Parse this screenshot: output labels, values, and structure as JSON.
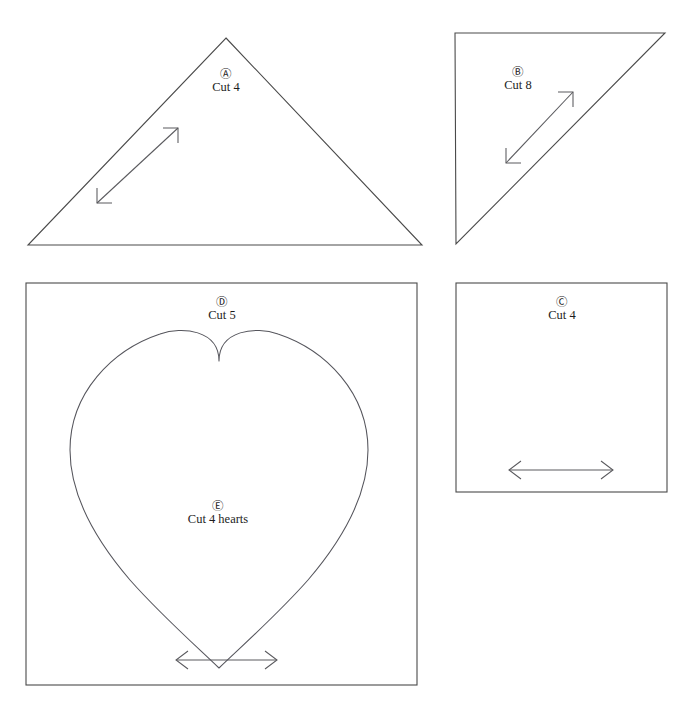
{
  "document": {
    "type": "quilt-pattern-template-sheet",
    "background_color": "#ffffff",
    "line_color": "#4a4a4a",
    "text_color": "#1d1d1d",
    "width": 685,
    "height": 705
  },
  "pieces": [
    {
      "id": "A",
      "letter": "Ⓐ",
      "letter_plain": "A",
      "cut_label": "Cut 4",
      "shape": "isosceles-triangle",
      "grain_arrow": "diagonal-up-right",
      "label_x": 226,
      "label_y": 68
    },
    {
      "id": "B",
      "letter": "Ⓑ",
      "letter_plain": "B",
      "cut_label": "Cut 8",
      "shape": "right-triangle",
      "grain_arrow": "diagonal-up-right",
      "label_x": 518,
      "label_y": 66
    },
    {
      "id": "C",
      "letter": "Ⓒ",
      "letter_plain": "C",
      "cut_label": "Cut 4",
      "shape": "square",
      "grain_arrow": "horizontal",
      "label_x": 562,
      "label_y": 296
    },
    {
      "id": "D",
      "letter": "Ⓓ",
      "letter_plain": "D",
      "cut_label": "Cut 5",
      "shape": "square",
      "grain_arrow": "horizontal",
      "label_x": 222,
      "label_y": 296
    },
    {
      "id": "E",
      "letter": "Ⓔ",
      "letter_plain": "E",
      "cut_label": "Cut 4 hearts",
      "shape": "heart",
      "grain_arrow": "none",
      "label_x": 218,
      "label_y": 500
    }
  ]
}
